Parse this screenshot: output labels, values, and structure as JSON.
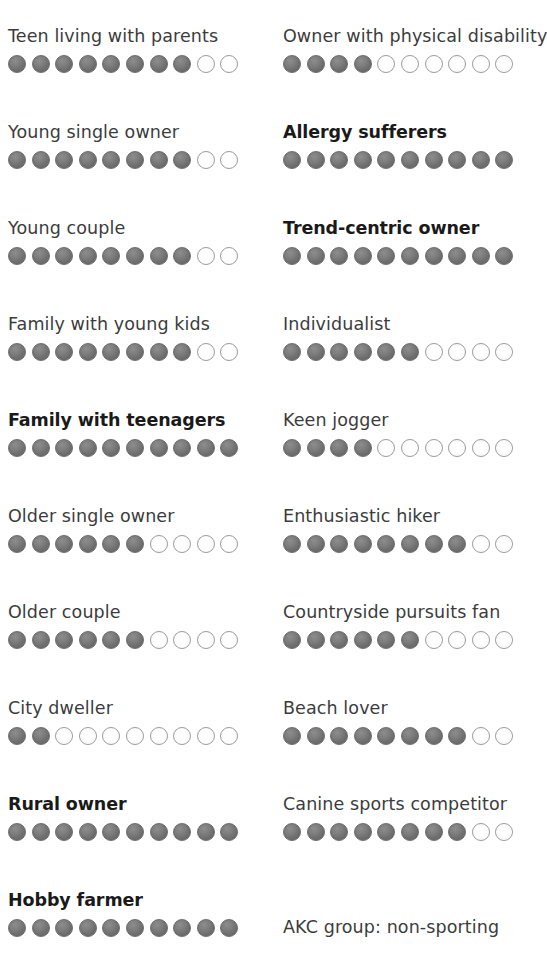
{
  "chart_data": {
    "type": "bar",
    "title": "",
    "subtitle": "",
    "xlabel": "",
    "ylabel": "",
    "scale_max": 10,
    "legend_position": "none",
    "grid": false,
    "notation": "Each row is a 0-10 dot-scale rating; filled dots indicate the score.",
    "categories": [
      "Teen living with parents",
      "Young single owner",
      "Young couple",
      "Family with young kids",
      "Family with teenagers",
      "Older single owner",
      "Older couple",
      "City dweller",
      "Rural owner",
      "Hobby farmer",
      "Owner with physical disability",
      "Allergy sufferers",
      "Trend-centric owner",
      "Individualist",
      "Keen jogger",
      "Enthusiastic hiker",
      "Countryside pursuits fan",
      "Beach lover",
      "Canine sports competitor"
    ],
    "values": [
      8,
      8,
      8,
      8,
      10,
      6,
      6,
      2,
      10,
      10,
      4,
      10,
      10,
      6,
      4,
      8,
      6,
      8,
      8
    ],
    "colors": {
      "filled_dot": "#6e6e6e",
      "empty_dot_border": "#9a9a9a",
      "label": "#3c3c3c",
      "label_highlight": "#1a1a1a",
      "background": "#ffffff"
    }
  },
  "columns": {
    "left": {
      "rows": [
        {
          "label": "Teen living with parents",
          "score": 8,
          "total": 10,
          "highlighted": false
        },
        {
          "label": "Young single owner",
          "score": 8,
          "total": 10,
          "highlighted": false
        },
        {
          "label": "Young couple",
          "score": 8,
          "total": 10,
          "highlighted": false
        },
        {
          "label": "Family with young kids",
          "score": 8,
          "total": 10,
          "highlighted": false
        },
        {
          "label": "Family with teenagers",
          "score": 10,
          "total": 10,
          "highlighted": true
        },
        {
          "label": "Older single owner",
          "score": 6,
          "total": 10,
          "highlighted": false
        },
        {
          "label": "Older couple",
          "score": 6,
          "total": 10,
          "highlighted": false
        },
        {
          "label": "City dweller",
          "score": 2,
          "total": 10,
          "highlighted": false
        },
        {
          "label": "Rural owner",
          "score": 10,
          "total": 10,
          "highlighted": true
        },
        {
          "label": "Hobby farmer",
          "score": 10,
          "total": 10,
          "highlighted": true
        }
      ]
    },
    "right": {
      "rows": [
        {
          "label": "Owner with physical disability",
          "score": 4,
          "total": 10,
          "highlighted": false
        },
        {
          "label": "Allergy sufferers",
          "score": 10,
          "total": 10,
          "highlighted": true
        },
        {
          "label": "Trend-centric owner",
          "score": 10,
          "total": 10,
          "highlighted": true
        },
        {
          "label": "Individualist",
          "score": 6,
          "total": 10,
          "highlighted": false
        },
        {
          "label": "Keen jogger",
          "score": 4,
          "total": 10,
          "highlighted": false
        },
        {
          "label": "Enthusiastic hiker",
          "score": 8,
          "total": 10,
          "highlighted": false
        },
        {
          "label": "Countryside pursuits fan",
          "score": 6,
          "total": 10,
          "highlighted": false
        },
        {
          "label": "Beach lover",
          "score": 8,
          "total": 10,
          "highlighted": false
        },
        {
          "label": "Canine sports competitor",
          "score": 8,
          "total": 10,
          "highlighted": false
        },
        {
          "label": "AKC group: non-sporting",
          "score": null,
          "total": 0,
          "highlighted": false
        }
      ]
    }
  }
}
